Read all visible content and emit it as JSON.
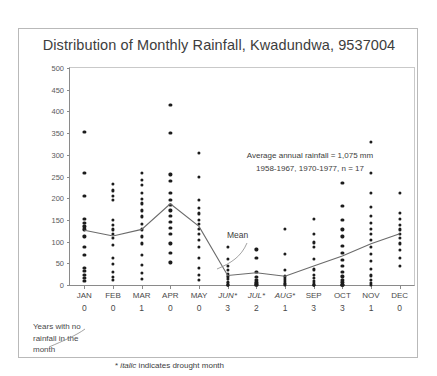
{
  "chart_data": {
    "type": "scatter",
    "title": "Distribution of Monthly Rainfall, Kwadundwa, 9537004",
    "xlabel": "",
    "ylabel": "Rainfall in mm",
    "ylim": [
      0,
      500
    ],
    "ytick_step": 50,
    "yticks": [
      0,
      50,
      100,
      150,
      200,
      250,
      300,
      350,
      400,
      450,
      500
    ],
    "grid": false,
    "legend": "none",
    "categories": [
      "JAN",
      "FEB",
      "MAR",
      "APR",
      "MAY",
      "JUN*",
      "JUL*",
      "AUG*",
      "SEP",
      "OCT",
      "NOV",
      "DEC"
    ],
    "drought_months": [
      "JUN*",
      "JUL*",
      "AUG*"
    ],
    "zero_rainfall_years": [
      0,
      0,
      1,
      0,
      0,
      3,
      2,
      1,
      3,
      3,
      1,
      0
    ],
    "mean_series": {
      "name": "Mean",
      "values": [
        126,
        113,
        128,
        187,
        135,
        22,
        28,
        20,
        44,
        67,
        95,
        118
      ]
    },
    "points": {
      "JAN": [
        352,
        258,
        205,
        152,
        143,
        135,
        128,
        112,
        88,
        70,
        40,
        32,
        24,
        16,
        10
      ],
      "FEB": [
        232,
        218,
        205,
        196,
        150,
        138,
        128,
        118,
        108,
        92,
        62,
        48,
        30,
        18,
        12
      ],
      "MAR": [
        258,
        242,
        230,
        212,
        198,
        188,
        172,
        158,
        140,
        128,
        112,
        96,
        70,
        46,
        28,
        14
      ],
      "APR": [
        415,
        350,
        255,
        240,
        212,
        196,
        185,
        172,
        160,
        146,
        132,
        118,
        96,
        74,
        52
      ],
      "MAY": [
        305,
        250,
        196,
        178,
        165,
        150,
        140,
        130,
        118,
        104,
        88,
        62,
        40,
        24,
        12
      ],
      "JUN*": [
        88,
        60,
        44,
        34,
        26,
        20,
        14,
        8,
        4,
        0,
        0,
        0
      ],
      "JUL*": [
        82,
        62,
        30,
        18,
        12,
        8,
        5,
        2,
        0,
        0
      ],
      "AUG*": [
        130,
        72,
        34,
        20,
        14,
        9,
        5,
        2,
        0
      ],
      "SEP": [
        152,
        118,
        98,
        88,
        60,
        36,
        24,
        16,
        10,
        5,
        0,
        0,
        0
      ],
      "OCT": [
        235,
        182,
        150,
        128,
        112,
        90,
        74,
        58,
        44,
        30,
        20,
        12,
        6,
        0,
        0,
        0
      ],
      "NOV": [
        330,
        258,
        212,
        180,
        160,
        144,
        130,
        118,
        104,
        88,
        72,
        56,
        38,
        22,
        12,
        4,
        0
      ],
      "DEC": [
        212,
        166,
        152,
        138,
        128,
        118,
        108,
        96,
        80,
        62,
        44
      ]
    },
    "annotation": {
      "line1": "Average annual rainfall = 1,075 mm",
      "line2": "1958-1967, 1970-1977, n = 17"
    },
    "mean_callout": "Mean",
    "years_note": "Years with no rainfall in the month",
    "drought_note_star": "*",
    "drought_note_italic": "italic",
    "drought_note_rest": "indicates drought month",
    "colors": {
      "dot": "#1c1c1c",
      "mean_line": "#6b6b6b",
      "axis": "#8a8a8a",
      "text": "#3d3d3d",
      "frame": "#b9b9b9"
    }
  }
}
